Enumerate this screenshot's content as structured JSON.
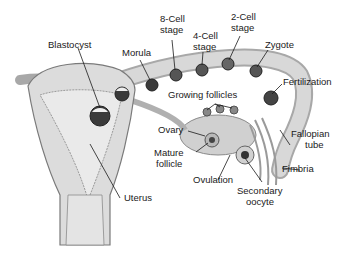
{
  "diagram": {
    "title": "",
    "colors": {
      "tissue": "#d8d8d8",
      "tissue_dark": "#a8a8a8",
      "outline": "#6a6a6a",
      "cell": "#3a3a3a",
      "leader": "#1a1a1a",
      "text": "#1a1a1a"
    },
    "labels": {
      "blastocyst": "Blastocyst",
      "morula": "Morula",
      "eight_cell_1": "8-Cell",
      "eight_cell_2": "stage",
      "four_cell_1": "4-Cell",
      "four_cell_2": "stage",
      "two_cell_1": "2-Cell",
      "two_cell_2": "stage",
      "zygote": "Zygote",
      "fertilization": "Fertilization",
      "growing_follicles": "Growing follicles",
      "ovary": "Ovary",
      "mature_follicle_1": "Mature",
      "mature_follicle_2": "follicle",
      "fallopian_tube_1": "Fallopian",
      "fallopian_tube_2": "tube",
      "fimbria": "Fimbria",
      "ovulation": "Ovulation",
      "secondary_oocyte_1": "Secondary",
      "secondary_oocyte_2": "oocyte",
      "uterus": "Uterus"
    }
  }
}
